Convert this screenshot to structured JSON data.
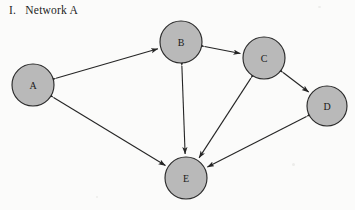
{
  "figure": {
    "title": "I.   Network A",
    "background_color": "#fbfbfa"
  },
  "style": {
    "node_fill": "#b9b9b9",
    "node_stroke": "#2a2a2a",
    "edge_color": "#252525",
    "label_color": "#1a1a1a"
  },
  "chart_data": {
    "type": "diagram",
    "title": "I.   Network A",
    "graph_kind": "directed-network",
    "nodes": [
      {
        "id": "A",
        "label": "A",
        "cx": 33,
        "cy": 85,
        "r": 21
      },
      {
        "id": "B",
        "label": "B",
        "cx": 181,
        "cy": 42,
        "r": 21
      },
      {
        "id": "C",
        "label": "C",
        "cx": 264,
        "cy": 58,
        "r": 21
      },
      {
        "id": "D",
        "label": "D",
        "cx": 327,
        "cy": 106,
        "r": 20
      },
      {
        "id": "E",
        "label": "E",
        "cx": 186,
        "cy": 178,
        "r": 21
      }
    ],
    "edges": [
      {
        "from": "A",
        "to": "B",
        "arrows": "both"
      },
      {
        "from": "A",
        "to": "E",
        "arrows": "both"
      },
      {
        "from": "B",
        "to": "C",
        "arrows": "both"
      },
      {
        "from": "B",
        "to": "E",
        "arrows": "both"
      },
      {
        "from": "C",
        "to": "D",
        "arrows": "both"
      },
      {
        "from": "C",
        "to": "E",
        "arrows": "both"
      },
      {
        "from": "D",
        "to": "E",
        "arrows": "both"
      }
    ],
    "node_count": 5,
    "edge_count": 7
  }
}
